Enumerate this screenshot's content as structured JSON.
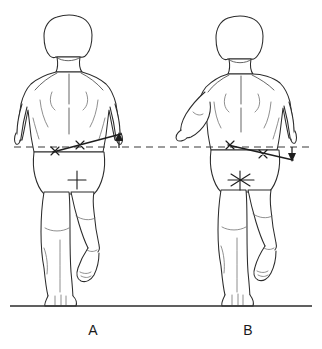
{
  "figure": {
    "type": "anatomical-line-drawing",
    "background_color": "#ffffff",
    "line_color": "#2b2b2b",
    "dimensions": {
      "width": 322,
      "height": 349
    }
  },
  "panels": [
    {
      "id": "A",
      "label": "A",
      "view": "posterior",
      "label_position": {
        "x": 93,
        "y": 330
      },
      "stance_leg": "viewer-left",
      "lifted_leg": "viewer-right",
      "arm_position": "both arms at sides",
      "pelvic_tilt_direction": "up-to-the-right",
      "arrow_direction": "up",
      "arrow": {
        "x": 119,
        "top_y": 134,
        "bottom_y": 148
      },
      "pelvic_line": {
        "x1": 53,
        "y1": 152,
        "x2": 121,
        "y2": 134
      },
      "landmarks": [
        {
          "name": "iliac-crest-left",
          "x": 55,
          "y": 151
        },
        {
          "name": "iliac-crest-right",
          "x": 80,
          "y": 145
        }
      ],
      "gluteal_marker": {
        "x": 77,
        "y": 180,
        "style": "cross"
      }
    },
    {
      "id": "B",
      "label": "B",
      "view": "posterior",
      "label_position": {
        "x": 248,
        "y": 330
      },
      "stance_leg": "viewer-left",
      "lifted_leg": "viewer-right",
      "arm_position": "viewer-left arm abducted away from body",
      "pelvic_tilt_direction": "down-to-the-right",
      "arrow_direction": "down",
      "arrow": {
        "x": 292,
        "top_y": 147,
        "bottom_y": 161
      },
      "pelvic_line": {
        "x1": 228,
        "y1": 145,
        "x2": 293,
        "y2": 160
      },
      "landmarks": [
        {
          "name": "iliac-crest-left",
          "x": 230,
          "y": 146
        },
        {
          "name": "iliac-crest-right",
          "x": 263,
          "y": 154
        }
      ],
      "gluteal_marker": {
        "x": 240,
        "y": 180,
        "style": "radiating-cross"
      }
    }
  ],
  "reference_line": {
    "name": "horizontal-reference",
    "style": "dashed",
    "y": 147,
    "x_start": 14,
    "x_end": 310
  },
  "ground_line": {
    "name": "ground",
    "style": "solid",
    "y": 306,
    "x_start": 10,
    "x_end": 312
  }
}
